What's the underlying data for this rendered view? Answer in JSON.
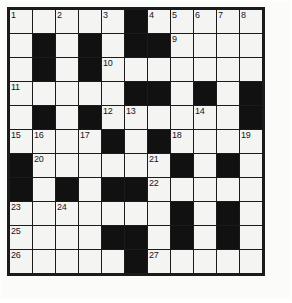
{
  "puzzle": {
    "type": "crossword-grid",
    "rows": 11,
    "cols": 11,
    "cell_size_px": 25,
    "colors": {
      "block": "#111111",
      "cell": "#f4f4f2",
      "border": "#1b1b1b",
      "number_text": "#15151a",
      "paper": "#fbfbfa"
    },
    "legend": {
      "white_cell": "open letter square",
      "black_cell": "blocked square"
    },
    "grid": [
      [
        "white",
        "white",
        "white",
        "white",
        "white",
        "black",
        "white",
        "white",
        "white",
        "white",
        "white"
      ],
      [
        "white",
        "black",
        "white",
        "black",
        "white",
        "black",
        "black",
        "white",
        "white",
        "white",
        "white"
      ],
      [
        "white",
        "black",
        "white",
        "black",
        "white",
        "white",
        "white",
        "white",
        "white",
        "white",
        "white"
      ],
      [
        "white",
        "white",
        "white",
        "white",
        "white",
        "black",
        "black",
        "white",
        "black",
        "white",
        "black"
      ],
      [
        "white",
        "black",
        "white",
        "black",
        "white",
        "white",
        "white",
        "white",
        "white",
        "white",
        "black"
      ],
      [
        "white",
        "white",
        "white",
        "white",
        "black",
        "white",
        "black",
        "white",
        "white",
        "white",
        "white"
      ],
      [
        "black",
        "white",
        "white",
        "white",
        "white",
        "white",
        "white",
        "black",
        "white",
        "black",
        "white"
      ],
      [
        "black",
        "white",
        "black",
        "white",
        "black",
        "black",
        "white",
        "white",
        "white",
        "white",
        "white"
      ],
      [
        "white",
        "white",
        "white",
        "white",
        "white",
        "white",
        "white",
        "black",
        "white",
        "black",
        "white"
      ],
      [
        "white",
        "white",
        "white",
        "white",
        "black",
        "black",
        "white",
        "black",
        "white",
        "black",
        "white"
      ],
      [
        "white",
        "white",
        "white",
        "white",
        "white",
        "black",
        "white",
        "white",
        "white",
        "white",
        "white"
      ]
    ],
    "numbers": [
      [
        "1",
        "",
        "2",
        "",
        "3",
        "",
        "4",
        "5",
        "6",
        "7",
        "8"
      ],
      [
        "",
        "",
        "",
        "",
        "",
        "",
        "",
        "9",
        "",
        "",
        ""
      ],
      [
        "",
        "",
        "",
        "",
        "10",
        "",
        "",
        "",
        "",
        "",
        ""
      ],
      [
        "11",
        "",
        "",
        "",
        "",
        "",
        "",
        "",
        "",
        "",
        ""
      ],
      [
        "",
        "",
        "",
        "",
        "12",
        "13",
        "",
        "",
        "14",
        "",
        ""
      ],
      [
        "15",
        "16",
        "",
        "17",
        "",
        "",
        "",
        "18",
        "",
        "",
        "19"
      ],
      [
        "",
        "20",
        "",
        "",
        "",
        "",
        "21",
        "",
        "",
        "",
        ""
      ],
      [
        "",
        "",
        "",
        "",
        "",
        "",
        "22",
        "",
        "",
        "",
        ""
      ],
      [
        "23",
        "",
        "24",
        "",
        "",
        "",
        "",
        "",
        "",
        "",
        ""
      ],
      [
        "25",
        "",
        "",
        "",
        "",
        "",
        "",
        "",
        "",
        "",
        ""
      ],
      [
        "26",
        "",
        "",
        "",
        "",
        "",
        "27",
        "",
        "",
        "",
        ""
      ]
    ],
    "numbered_squares": [
      {
        "number": "1",
        "row": 1,
        "col": 1
      },
      {
        "number": "2",
        "row": 1,
        "col": 3
      },
      {
        "number": "3",
        "row": 1,
        "col": 5
      },
      {
        "number": "4",
        "row": 1,
        "col": 7
      },
      {
        "number": "5",
        "row": 1,
        "col": 8
      },
      {
        "number": "6",
        "row": 1,
        "col": 9
      },
      {
        "number": "7",
        "row": 1,
        "col": 10
      },
      {
        "number": "8",
        "row": 1,
        "col": 11
      },
      {
        "number": "9",
        "row": 2,
        "col": 8
      },
      {
        "number": "10",
        "row": 3,
        "col": 5
      },
      {
        "number": "11",
        "row": 4,
        "col": 1
      },
      {
        "number": "12",
        "row": 5,
        "col": 5
      },
      {
        "number": "13",
        "row": 5,
        "col": 6
      },
      {
        "number": "14",
        "row": 5,
        "col": 9
      },
      {
        "number": "15",
        "row": 6,
        "col": 1
      },
      {
        "number": "16",
        "row": 6,
        "col": 2
      },
      {
        "number": "17",
        "row": 6,
        "col": 4
      },
      {
        "number": "18",
        "row": 6,
        "col": 8
      },
      {
        "number": "19",
        "row": 6,
        "col": 11
      },
      {
        "number": "20",
        "row": 7,
        "col": 2
      },
      {
        "number": "21",
        "row": 7,
        "col": 7
      },
      {
        "number": "22",
        "row": 8,
        "col": 7
      },
      {
        "number": "23",
        "row": 9,
        "col": 1
      },
      {
        "number": "24",
        "row": 9,
        "col": 3
      },
      {
        "number": "25",
        "row": 10,
        "col": 1
      },
      {
        "number": "26",
        "row": 11,
        "col": 1
      },
      {
        "number": "27",
        "row": 11,
        "col": 7
      }
    ],
    "entries": []
  }
}
